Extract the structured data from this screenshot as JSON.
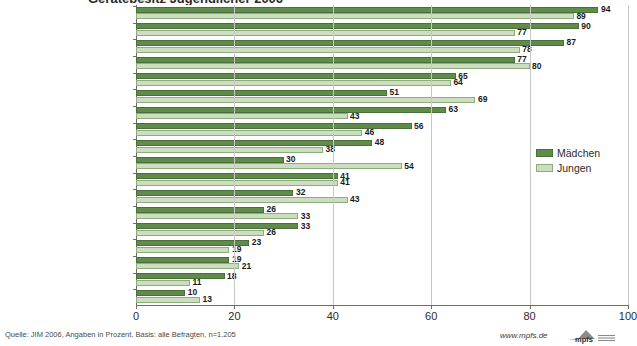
{
  "title": {
    "text": "Gerätebesitz Jugendlicher 2006"
  },
  "legend": {
    "position": "right",
    "entries": [
      {
        "label": "Mädchen",
        "color": "#5f8c4b",
        "key": "girls"
      },
      {
        "label": "Jungen",
        "color": "#cdddc1",
        "key": "boys"
      }
    ]
  },
  "axis": {
    "ticks": [
      "0",
      "20",
      "40",
      "60",
      "80",
      "100"
    ],
    "min": 0,
    "max": 100
  },
  "footer": {
    "source": "Quelle: JIM 2006, Angaben in Prozent, Basis: alle Befragten, n=1.205",
    "url": "www.mpfs.de",
    "logo_text": "mpfs"
  },
  "chart_data": {
    "type": "bar",
    "orientation": "horizontal",
    "title": "Gerätebesitz Jugendlicher 2006",
    "xlabel": "",
    "ylabel": "",
    "xlim": [
      0,
      100
    ],
    "grid": true,
    "legend_position": "right",
    "categories": [
      "Handy",
      "CD-Player",
      "Radio",
      "MP3-Player",
      "Fernsehgerät",
      "Computer/Laptop",
      "Walkman, Discman",
      "Kassettenrekorder",
      "Videorekorder",
      "Spielkonsole TV/PC",
      "DVD-Player (nicht PC)",
      "Internetzugang",
      "and. tragb. Spielkonsolen",
      "Digitalkamera",
      "Mini-Radio",
      "UMTS-Handy [/-Karte]",
      "Mini-Disc-Rekorder",
      "PSP"
    ],
    "series": [
      {
        "name": "Mädchen",
        "color": "#5f8c4b",
        "values": [
          94,
          90,
          87,
          77,
          65,
          51,
          63,
          56,
          48,
          30,
          41,
          32,
          26,
          33,
          23,
          19,
          18,
          10
        ]
      },
      {
        "name": "Jungen",
        "color": "#cdddc1",
        "values": [
          89,
          77,
          78,
          80,
          64,
          69,
          43,
          46,
          38,
          54,
          41,
          43,
          33,
          26,
          19,
          21,
          11,
          13
        ]
      }
    ]
  }
}
